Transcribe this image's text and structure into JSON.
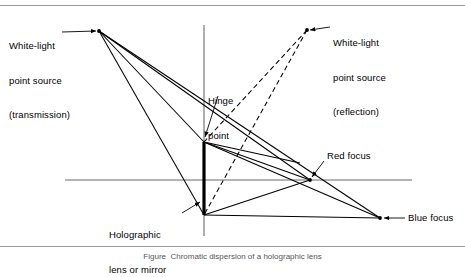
{
  "figure": {
    "caption": "Figure  Chromatic dispersion of a holographic lens",
    "labels": {
      "source_transmission": "White-light\npoint source\n(transmission)",
      "source_transmission_line1": "White-light",
      "source_transmission_line2": "point source",
      "source_transmission_line3": "(transmission)",
      "source_reflection_line1": "White-light",
      "source_reflection_line2": "point source",
      "source_reflection_line3": "(reflection)",
      "hinge_line1": "Hinge",
      "hinge_line2": "point",
      "holographic_line1": "Holographic",
      "holographic_line2": "lens or mirror",
      "red_focus": "Red focus",
      "blue_focus": "Blue focus"
    },
    "colors": {
      "ink": "#000000",
      "axis": "#555555",
      "border": "#999999",
      "background": "#ffffff"
    },
    "points": {
      "source_transmission": {
        "x": 99,
        "y": 31
      },
      "source_reflection": {
        "x": 307,
        "y": 30
      },
      "lens_top": {
        "x": 204,
        "y": 142
      },
      "lens_bottom": {
        "x": 204,
        "y": 215
      },
      "red_focus": {
        "x": 310,
        "y": 180
      },
      "blue_focus": {
        "x": 380,
        "y": 218
      },
      "hinge_point": {
        "x": 204,
        "y": 142
      }
    },
    "axes": {
      "vertical": {
        "x": 204,
        "y1": 25,
        "y2": 236
      },
      "horizontal": {
        "y": 180,
        "x1": 65,
        "x2": 412
      }
    },
    "rays": {
      "transmission_style": "solid",
      "reflection_style": "dashed",
      "lens_style": "thick-solid"
    }
  }
}
